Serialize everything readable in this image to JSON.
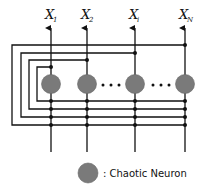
{
  "diagram": {
    "type": "recurrent chaotic neural network",
    "outputs": [
      {
        "base": "X",
        "sub": "1"
      },
      {
        "base": "X",
        "sub": "2"
      },
      {
        "base": "X",
        "sub": "i"
      },
      {
        "base": "X",
        "sub": "N"
      }
    ],
    "ellipsis": "· · ·",
    "legend": {
      "label": ": Chaotic Neuron"
    },
    "colors": {
      "neuron": "#7a7a7a",
      "line": "#111111",
      "background": "#ffffff"
    }
  }
}
